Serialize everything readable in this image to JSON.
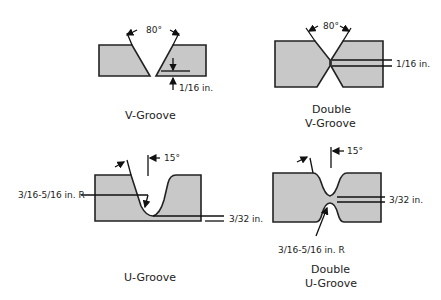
{
  "colors": {
    "fill": "#c8c8c8",
    "stroke": "#222222",
    "background": "#ffffff"
  },
  "diagrams": [
    {
      "id": "v-groove",
      "caption": [
        "V-Groove"
      ],
      "angle": "80°",
      "dimension": "1/16 in."
    },
    {
      "id": "double-v-groove",
      "caption": [
        "Double",
        "V-Groove"
      ],
      "angle": "80°",
      "dimension": "1/16 in."
    },
    {
      "id": "u-groove",
      "caption": [
        "U-Groove"
      ],
      "angle": "15°",
      "radius": "3/16-5/16 in. R",
      "dimension": "3/32 in."
    },
    {
      "id": "double-u-groove",
      "caption": [
        "Double",
        "U-Groove"
      ],
      "angle": "15°",
      "radius": "3/16-5/16 in. R",
      "dimension": "3/32 in."
    }
  ]
}
